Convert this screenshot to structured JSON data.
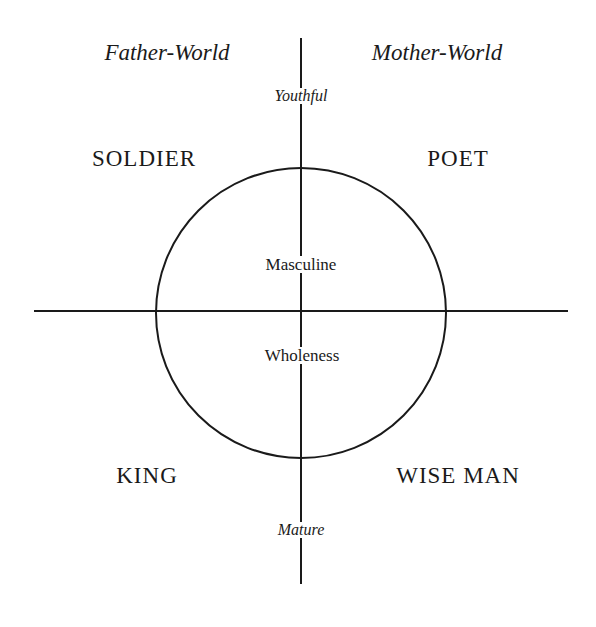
{
  "worlds": {
    "left": "Father-World",
    "right": "Mother-World"
  },
  "axis": {
    "top": "Youthful",
    "bottom": "Mature"
  },
  "center": {
    "upper": "Masculine",
    "lower": "Wholeness"
  },
  "archetypes": {
    "top_left": "SOLDIER",
    "top_right": "POET",
    "bottom_left": "KING",
    "bottom_right": "WISE MAN"
  },
  "colors": {
    "line": "#1a1a1a",
    "background": "#ffffff"
  }
}
